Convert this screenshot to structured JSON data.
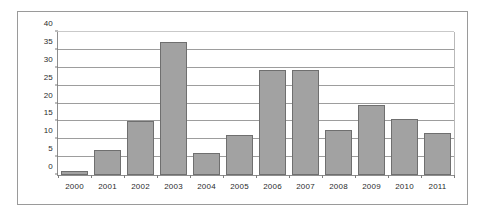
{
  "chart_data": {
    "type": "bar",
    "title": "",
    "xlabel": "",
    "ylabel": "",
    "categories": [
      "2000",
      "2001",
      "2002",
      "2003",
      "2004",
      "2005",
      "2006",
      "2007",
      "2008",
      "2009",
      "2010",
      "2011"
    ],
    "values": [
      1,
      7,
      15.2,
      37.2,
      6.2,
      11.2,
      29.4,
      29.5,
      12.6,
      19.7,
      15.8,
      11.7
    ],
    "ylim": [
      0,
      40
    ],
    "ytick_labels": [
      "0",
      "5",
      "10",
      "15",
      "20",
      "25",
      "30",
      "35",
      "40"
    ],
    "ytick_values": [
      0,
      5,
      10,
      15,
      20,
      25,
      30,
      35,
      40
    ],
    "grid": true,
    "legend": "none",
    "series_name": "",
    "colors": {
      "bar_fill": "#a2a2a2",
      "bar_border": "#6f6f6f",
      "gridline": "#9d9d9d",
      "axis": "#8d8d8d",
      "frame": "#9a9a9a",
      "text": "#2b2b2b",
      "background": "#ffffff"
    }
  }
}
